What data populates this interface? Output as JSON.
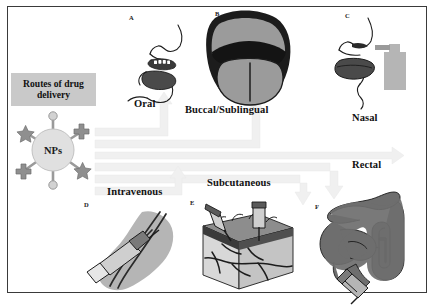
{
  "figure": {
    "kind": "routes-of-drug-delivery-diagram",
    "background_color": "#ffffff",
    "frame_color": "#3a3a3a",
    "width": 434,
    "height": 305
  },
  "center": {
    "title_line1": "Routes of drug",
    "title_line2": "delivery",
    "title_box_color": "#c9c9c9",
    "nanoparticle_label": "NPs",
    "nanoparticle_color": "#e0e0e0",
    "ligand_color": "#9a9a9a"
  },
  "arrows": {
    "color": "#f0f0f0",
    "stroke": "#e4e4e4",
    "count": 6,
    "targets": [
      "Oral",
      "Buccal/Sublingual",
      "Nasal",
      "Rectal",
      "Subcutaneous",
      "Intravenous"
    ]
  },
  "routes": [
    {
      "letter": "A",
      "label": "Oral",
      "letter_x": 129,
      "letter_y": 18,
      "label_x": 134,
      "label_y": 105
    },
    {
      "letter": "B",
      "label": "Buccal/Sublingual",
      "letter_x": 215,
      "letter_y": 13,
      "label_x": 185,
      "label_y": 111
    },
    {
      "letter": "C",
      "label": "Nasal",
      "letter_x": 345,
      "letter_y": 15,
      "label_x": 352,
      "label_y": 119
    },
    {
      "letter": "D",
      "label": "Intravenous",
      "letter_x": 84,
      "letter_y": 205,
      "label_x": 107,
      "label_y": 192
    },
    {
      "letter": "E",
      "label": "Subcutaneous",
      "letter_x": 190,
      "letter_y": 203,
      "label_x": 207,
      "label_y": 183
    },
    {
      "letter": "F",
      "label": "Rectal",
      "letter_x": 315,
      "letter_y": 207,
      "label_x": 352,
      "label_y": 166
    }
  ],
  "art": {
    "ink": "#1c1c1c",
    "mid_gray": "#6e6e6e",
    "dark_gray": "#4a4a4a",
    "light_gray": "#b5b5b5",
    "pale_gray": "#d6d6d6",
    "tongue_gray": "#9b9b9b"
  }
}
